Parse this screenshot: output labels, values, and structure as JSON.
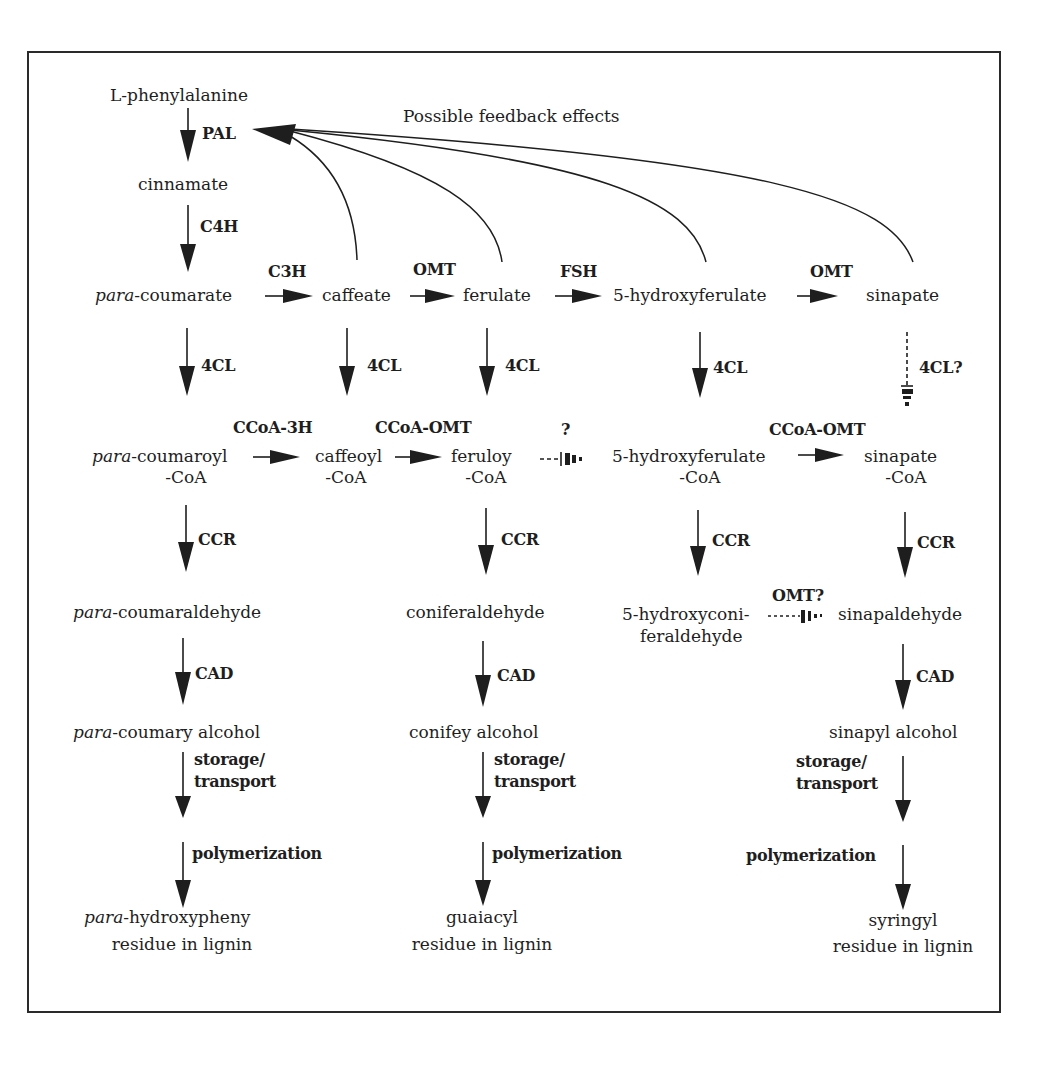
{
  "figure": {
    "title_note": "Possible feedback effects",
    "start": "L-phenylalanine",
    "steps": {
      "pal": "PAL",
      "cinnamate": "cinnamate",
      "c4h": "C4H"
    },
    "acids": {
      "p_coumarate_prefix": "para",
      "p_coumarate_suffix": "-coumarate",
      "caffeate": "caffeate",
      "ferulate": "ferulate",
      "hydroxyferulate": "5-hydroxyferulate",
      "sinapate": "sinapate",
      "c3h": "C3H",
      "omt1": "OMT",
      "f5h": "FSH",
      "omt2": "OMT"
    },
    "ligases": {
      "col1": "4CL",
      "col2": "4CL",
      "col3": "4CL",
      "col4": "4CL",
      "col5": "4CL?"
    },
    "coas": {
      "p_coumaroyl_prefix": "para",
      "p_coumaroyl_suffix": "-coumaroyl",
      "p_coumaroyl_line2": "-CoA",
      "caffeoyl": "caffeoyl",
      "caffeoyl_line2": "-CoA",
      "feruloy": "feruloy",
      "feruloy_line2": "-CoA",
      "hydroxyferulate": "5-hydroxyferulate",
      "hydroxyferulate_line2": "-CoA",
      "sinapate": "sinapate",
      "sinapate_line2": "-CoA",
      "ccoa3h": "CCoA-3H",
      "ccoaomt1": "CCoA-OMT",
      "unknown": "?",
      "ccoaomt2": "CCoA-OMT"
    },
    "reductases": {
      "col1": "CCR",
      "col3": "CCR",
      "col4": "CCR",
      "col5": "CCR"
    },
    "aldehydes": {
      "p_coumaraldehyde_prefix": "para",
      "p_coumaraldehyde_suffix": "-coumaraldehyde",
      "coniferaldehyde": "coniferaldehyde",
      "hydroxyconiferaldehyde_line1": "5-hydroxyconi-",
      "hydroxyconiferaldehyde_line2": "feraldehyde",
      "sinapaldehyde": "sinapaldehyde",
      "omt_q": "OMT?"
    },
    "dehydrogenases": {
      "col1": "CAD",
      "col3": "CAD",
      "col5": "CAD"
    },
    "alcohols": {
      "p_coumaryl_prefix": "para",
      "p_coumaryl_suffix": "-coumary alcohol",
      "coniferyl": "conifey alcohol",
      "sinapyl": "sinapyl alcohol"
    },
    "transport": {
      "line1": "storage/",
      "line2": "transport"
    },
    "polymerization": "polymerization",
    "residues": {
      "h_prefix": "para",
      "h_suffix": "-hydroxypheny",
      "g": "guaiacyl",
      "s": "syringyl",
      "line2": "residue in lignin"
    }
  }
}
